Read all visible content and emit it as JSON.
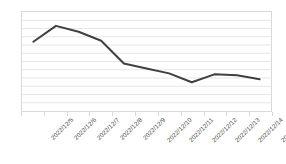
{
  "chart_data": {
    "type": "line",
    "title": "",
    "subtitle": "",
    "xlabel": "",
    "ylabel": "",
    "categories": [
      "2022/12/5",
      "2022/12/6",
      "2022/12/7",
      "2022/12/8",
      "2022/12/9",
      "2022/12/10",
      "2022/12/11",
      "2022/12/12",
      "2022/12/13",
      "2022/12/14",
      "2022/12/15"
    ],
    "values": [
      70,
      86,
      80,
      71,
      48,
      43,
      38,
      29,
      37,
      36,
      32
    ],
    "ylim": [
      0,
      100
    ],
    "y_tick_labels": [],
    "gridlines": 11,
    "grid": true,
    "legend": "none",
    "series_color": "#404040",
    "grid_color": "#e6e6e6",
    "border_color": "#d9d9d9",
    "axis_label_color": "#4a4a4a",
    "markers": false,
    "line_width": 2
  },
  "caption": {
    "text": ""
  }
}
